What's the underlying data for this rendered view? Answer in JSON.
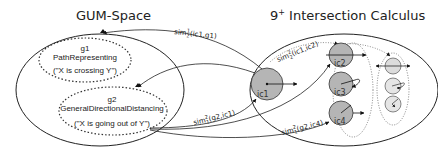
{
  "diagram": {
    "left_space": {
      "title": "GUM-Space",
      "nodes": [
        {
          "id": "g1",
          "name": "PathRepresenting",
          "example": "(\"X is crossing Y\")"
        },
        {
          "id": "g2",
          "name": "GeneralDirectionalDistancing",
          "example": "(\"X is going out of Y\")"
        }
      ]
    },
    "right_space": {
      "title_base": "9",
      "title_sup": "+",
      "title_rest": " Intersection Calculus",
      "nodes": [
        {
          "id": "ic1"
        },
        {
          "id": "ic2"
        },
        {
          "id": "ic3"
        },
        {
          "id": "ic4"
        }
      ]
    },
    "edges": [
      {
        "label_base": "sim",
        "sup": "1",
        "sub": "2",
        "args": "(ic1,g1)"
      },
      {
        "label_base": "sim",
        "sup": "2",
        "sub": "2",
        "args": "(ic1,ic2)"
      },
      {
        "label_base": "sim",
        "sup": "2",
        "sub": "1",
        "args": "(g2,ic1)"
      },
      {
        "label_base": "sim",
        "sup": "2",
        "sub": "1",
        "args": "(g2,ic4)"
      }
    ],
    "colors": {
      "stroke": "#222222",
      "circle_fill_dark": "#b5b5b5",
      "circle_fill_light": "#dcdcdc",
      "dotted": "#555555"
    }
  }
}
